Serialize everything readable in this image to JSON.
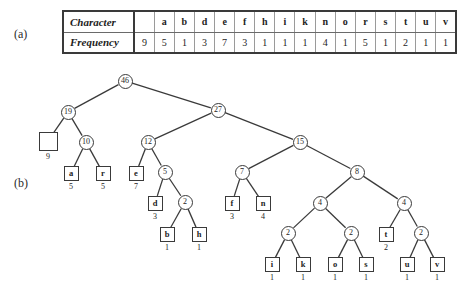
{
  "figure": {
    "labels": {
      "part_a": "(a)",
      "part_b": "(b)"
    }
  },
  "table": {
    "row_headers": [
      "Character",
      "Frequency"
    ],
    "characters": [
      "",
      "a",
      "b",
      "d",
      "e",
      "f",
      "h",
      "i",
      "k",
      "n",
      "o",
      "r",
      "s",
      "t",
      "u",
      "v"
    ],
    "frequencies": [
      9,
      5,
      1,
      3,
      7,
      3,
      1,
      1,
      1,
      4,
      1,
      5,
      1,
      2,
      1,
      1
    ]
  },
  "chart_data": {
    "type": "diagram",
    "nodes": [
      {
        "id": "n46",
        "label": "46",
        "kind": "internal",
        "x": 125,
        "y": 15
      },
      {
        "id": "n19",
        "label": "19",
        "kind": "internal",
        "x": 68,
        "y": 46
      },
      {
        "id": "n27",
        "label": "27",
        "kind": "internal",
        "x": 218,
        "y": 44
      },
      {
        "id": "lsp",
        "label": "",
        "kind": "leaf-blank",
        "freq": "9",
        "x": 48,
        "y": 75
      },
      {
        "id": "n10",
        "label": "10",
        "kind": "internal",
        "x": 86,
        "y": 76
      },
      {
        "id": "n12",
        "label": "12",
        "kind": "internal",
        "x": 148,
        "y": 76
      },
      {
        "id": "n15",
        "label": "15",
        "kind": "internal",
        "x": 300,
        "y": 76
      },
      {
        "id": "la",
        "label": "a",
        "kind": "leaf",
        "freq": "5",
        "x": 71,
        "y": 107
      },
      {
        "id": "lr",
        "label": "r",
        "kind": "leaf",
        "freq": "5",
        "x": 103,
        "y": 107
      },
      {
        "id": "le",
        "label": "e",
        "kind": "leaf",
        "freq": "7",
        "x": 136,
        "y": 107
      },
      {
        "id": "n5",
        "label": "5",
        "kind": "internal",
        "x": 165,
        "y": 106
      },
      {
        "id": "n7",
        "label": "7",
        "kind": "internal",
        "x": 242,
        "y": 106
      },
      {
        "id": "n8",
        "label": "8",
        "kind": "internal",
        "x": 357,
        "y": 106
      },
      {
        "id": "ld",
        "label": "d",
        "kind": "leaf",
        "freq": "3",
        "x": 155,
        "y": 137
      },
      {
        "id": "n2b",
        "label": "2",
        "kind": "internal",
        "x": 185,
        "y": 136
      },
      {
        "id": "lf",
        "label": "f",
        "kind": "leaf",
        "freq": "3",
        "x": 232,
        "y": 137
      },
      {
        "id": "ln",
        "label": "n",
        "kind": "leaf",
        "freq": "4",
        "x": 263,
        "y": 137
      },
      {
        "id": "n4l",
        "label": "4",
        "kind": "internal",
        "x": 320,
        "y": 137
      },
      {
        "id": "n4r",
        "label": "4",
        "kind": "internal",
        "x": 404,
        "y": 137
      },
      {
        "id": "lb",
        "label": "b",
        "kind": "leaf",
        "freq": "1",
        "x": 167,
        "y": 168
      },
      {
        "id": "lh",
        "label": "h",
        "kind": "leaf",
        "freq": "1",
        "x": 199,
        "y": 168
      },
      {
        "id": "n2i",
        "label": "2",
        "kind": "internal",
        "x": 288,
        "y": 167
      },
      {
        "id": "n2o",
        "label": "2",
        "kind": "internal",
        "x": 351,
        "y": 167
      },
      {
        "id": "lt",
        "label": "t",
        "kind": "leaf",
        "freq": "2",
        "x": 386,
        "y": 168
      },
      {
        "id": "n2u",
        "label": "2",
        "kind": "internal",
        "x": 421,
        "y": 167
      },
      {
        "id": "li",
        "label": "i",
        "kind": "leaf",
        "freq": "1",
        "x": 272,
        "y": 198
      },
      {
        "id": "lk",
        "label": "k",
        "kind": "leaf",
        "freq": "1",
        "x": 303,
        "y": 198
      },
      {
        "id": "lo",
        "label": "o",
        "kind": "leaf",
        "freq": "1",
        "x": 335,
        "y": 198
      },
      {
        "id": "ls",
        "label": "s",
        "kind": "leaf",
        "freq": "1",
        "x": 366,
        "y": 198
      },
      {
        "id": "lu",
        "label": "u",
        "kind": "leaf",
        "freq": "1",
        "x": 407,
        "y": 198
      },
      {
        "id": "lv",
        "label": "v",
        "kind": "leaf",
        "freq": "1",
        "x": 437,
        "y": 198
      }
    ],
    "edges": [
      [
        "n46",
        "n19"
      ],
      [
        "n46",
        "n27"
      ],
      [
        "n19",
        "lsp"
      ],
      [
        "n19",
        "n10"
      ],
      [
        "n10",
        "la"
      ],
      [
        "n10",
        "lr"
      ],
      [
        "n27",
        "n12"
      ],
      [
        "n27",
        "n15"
      ],
      [
        "n12",
        "le"
      ],
      [
        "n12",
        "n5"
      ],
      [
        "n5",
        "ld"
      ],
      [
        "n5",
        "n2b"
      ],
      [
        "n2b",
        "lb"
      ],
      [
        "n2b",
        "lh"
      ],
      [
        "n15",
        "n7"
      ],
      [
        "n15",
        "n8"
      ],
      [
        "n7",
        "lf"
      ],
      [
        "n7",
        "ln"
      ],
      [
        "n8",
        "n4l"
      ],
      [
        "n8",
        "n4r"
      ],
      [
        "n4l",
        "n2i"
      ],
      [
        "n4l",
        "n2o"
      ],
      [
        "n2i",
        "li"
      ],
      [
        "n2i",
        "lk"
      ],
      [
        "n2o",
        "lo"
      ],
      [
        "n2o",
        "ls"
      ],
      [
        "n4r",
        "lt"
      ],
      [
        "n4r",
        "n2u"
      ],
      [
        "n2u",
        "lu"
      ],
      [
        "n2u",
        "lv"
      ]
    ]
  }
}
